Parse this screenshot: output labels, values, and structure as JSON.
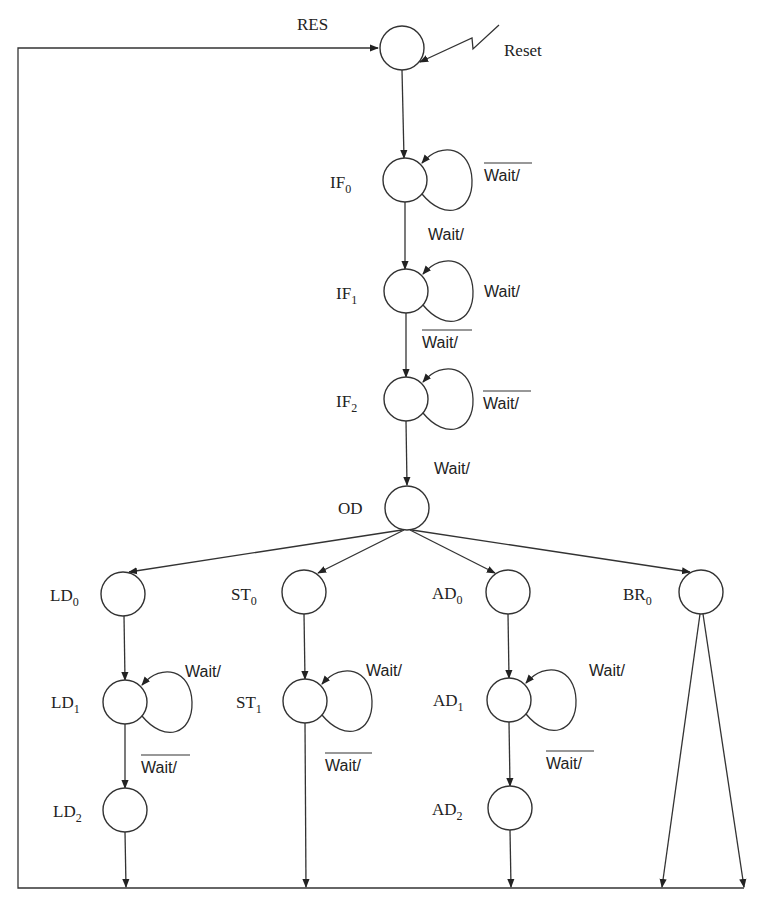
{
  "diagram": {
    "type": "state-machine",
    "title": "",
    "reset_input_label": "Reset",
    "reset_state_label": "RES",
    "states": [
      {
        "id": "RES",
        "label": "",
        "base": "",
        "sub": "",
        "x": 402,
        "y": 48
      },
      {
        "id": "IF0",
        "label": "IF0",
        "base": "IF",
        "sub": "0",
        "x": 405,
        "y": 180
      },
      {
        "id": "IF1",
        "label": "IF1",
        "base": "IF",
        "sub": "1",
        "x": 406,
        "y": 291
      },
      {
        "id": "IF2",
        "label": "IF2",
        "base": "IF",
        "sub": "2",
        "x": 406,
        "y": 399
      },
      {
        "id": "OD",
        "label": "OD",
        "base": "OD",
        "sub": "",
        "x": 407,
        "y": 508
      },
      {
        "id": "LD0",
        "label": "LD0",
        "base": "LD",
        "sub": "0",
        "x": 123,
        "y": 594
      },
      {
        "id": "LD1",
        "label": "LD1",
        "base": "LD",
        "sub": "1",
        "x": 125,
        "y": 702
      },
      {
        "id": "LD2",
        "label": "LD2",
        "base": "LD",
        "sub": "2",
        "x": 125,
        "y": 810
      },
      {
        "id": "ST0",
        "label": "ST0",
        "base": "ST",
        "sub": "0",
        "x": 304,
        "y": 592
      },
      {
        "id": "ST1",
        "label": "ST1",
        "base": "ST",
        "sub": "1",
        "x": 305,
        "y": 701
      },
      {
        "id": "AD0",
        "label": "AD0",
        "base": "AD",
        "sub": "0",
        "x": 508,
        "y": 592
      },
      {
        "id": "AD1",
        "label": "AD1",
        "base": "AD",
        "sub": "1",
        "x": 509,
        "y": 700
      },
      {
        "id": "AD2",
        "label": "AD2",
        "base": "AD",
        "sub": "2",
        "x": 510,
        "y": 808
      },
      {
        "id": "BR0",
        "label": "BR0",
        "base": "BR",
        "sub": "0",
        "x": 701,
        "y": 592
      }
    ],
    "transitions": [
      {
        "from": "Reset",
        "to": "RES",
        "label": "Reset"
      },
      {
        "from": "RES",
        "to": "IF0",
        "label": ""
      },
      {
        "from": "IF0",
        "to": "IF0",
        "label": "Wait/",
        "negated": true
      },
      {
        "from": "IF0",
        "to": "IF1",
        "label": "Wait/",
        "negated": false
      },
      {
        "from": "IF1",
        "to": "IF1",
        "label": "Wait/",
        "negated": false
      },
      {
        "from": "IF1",
        "to": "IF2",
        "label": "Wait/",
        "negated": true
      },
      {
        "from": "IF2",
        "to": "IF2",
        "label": "Wait/",
        "negated": true
      },
      {
        "from": "IF2",
        "to": "OD",
        "label": "Wait/",
        "negated": false
      },
      {
        "from": "OD",
        "to": "LD0",
        "label": ""
      },
      {
        "from": "OD",
        "to": "ST0",
        "label": ""
      },
      {
        "from": "OD",
        "to": "AD0",
        "label": ""
      },
      {
        "from": "OD",
        "to": "BR0",
        "label": ""
      },
      {
        "from": "LD0",
        "to": "LD1",
        "label": ""
      },
      {
        "from": "LD1",
        "to": "LD1",
        "label": "Wait/",
        "negated": false
      },
      {
        "from": "LD1",
        "to": "LD2",
        "label": "Wait/",
        "negated": true
      },
      {
        "from": "LD2",
        "to": "RES",
        "label": ""
      },
      {
        "from": "ST0",
        "to": "ST1",
        "label": ""
      },
      {
        "from": "ST1",
        "to": "ST1",
        "label": "Wait/",
        "negated": false
      },
      {
        "from": "ST1",
        "to": "RES",
        "label": "Wait/",
        "negated": true
      },
      {
        "from": "AD0",
        "to": "AD1",
        "label": ""
      },
      {
        "from": "AD1",
        "to": "AD1",
        "label": "Wait/",
        "negated": false
      },
      {
        "from": "AD1",
        "to": "AD2",
        "label": "Wait/",
        "negated": true
      },
      {
        "from": "AD2",
        "to": "RES",
        "label": ""
      },
      {
        "from": "BR0",
        "to": "RES",
        "label": ""
      },
      {
        "from": "BR0",
        "to": "RES",
        "label": ""
      }
    ],
    "condition_labels": {
      "if0_self": "Wait/",
      "if0_to_if1": "Wait/",
      "if1_self": "Wait/",
      "if1_to_if2": "Wait/",
      "if2_self": "Wait/",
      "if2_to_od": "Wait/",
      "ld1_self": "Wait/",
      "ld1_to_ld2": "Wait/",
      "st1_self": "Wait/",
      "st1_exit": "Wait/",
      "ad1_self": "Wait/",
      "ad1_to_ad2": "Wait/"
    },
    "state_labels": {
      "IF0": {
        "base": "IF",
        "sub": "0"
      },
      "IF1": {
        "base": "IF",
        "sub": "1"
      },
      "IF2": {
        "base": "IF",
        "sub": "2"
      },
      "OD": {
        "base": "OD",
        "sub": ""
      },
      "LD0": {
        "base": "LD",
        "sub": "0"
      },
      "LD1": {
        "base": "LD",
        "sub": "1"
      },
      "LD2": {
        "base": "LD",
        "sub": "2"
      },
      "ST0": {
        "base": "ST",
        "sub": "0"
      },
      "ST1": {
        "base": "ST",
        "sub": "1"
      },
      "AD0": {
        "base": "AD",
        "sub": "0"
      },
      "AD1": {
        "base": "AD",
        "sub": "1"
      },
      "AD2": {
        "base": "AD",
        "sub": "2"
      },
      "BR0": {
        "base": "BR",
        "sub": "0"
      }
    },
    "colors": {
      "stroke": "#333333",
      "text": "#222222",
      "background": "#ffffff"
    }
  }
}
